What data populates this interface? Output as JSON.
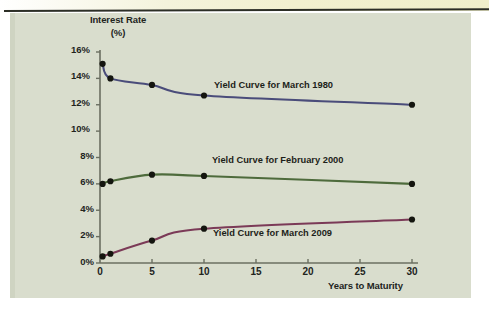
{
  "figure": {
    "background_color": "#d9ddcd",
    "page_color": "#ffffff",
    "top_strip_color": "#f1efcd",
    "rule_color": "#2c2e26"
  },
  "axes": {
    "y_title_line1": "Interest Rate",
    "y_title_line2": "(%)",
    "x_title": "Years to Maturity",
    "y_ticks": [
      "0%",
      "2%",
      "4%",
      "6%",
      "8%",
      "10%",
      "12%",
      "14%",
      "16%"
    ],
    "x_ticks": [
      "0",
      "5",
      "10",
      "15",
      "20",
      "25",
      "30"
    ],
    "axis_color": "#6b6f61"
  },
  "annotations": {
    "label_1980": "Yield Curve for March 1980",
    "label_2000": "Yield Curve for February 2000",
    "label_2009": "Yield Curve for March 2009"
  },
  "chart_data": {
    "type": "line",
    "title": "",
    "xlabel": "Years to Maturity",
    "ylabel": "Interest Rate (%)",
    "xlim": [
      0,
      30
    ],
    "ylim": [
      0,
      16
    ],
    "x_ticks": [
      0,
      5,
      10,
      15,
      20,
      25,
      30
    ],
    "y_ticks": [
      0,
      2,
      4,
      6,
      8,
      10,
      12,
      14,
      16
    ],
    "grid": false,
    "legend": "inline-annotations",
    "markers": "filled-circle",
    "series": [
      {
        "name": "Yield Curve for March 1980",
        "color": "#4a4c7a",
        "x": [
          0.25,
          1,
          5,
          10,
          30
        ],
        "values": [
          15.1,
          14.0,
          13.5,
          12.7,
          12.0
        ]
      },
      {
        "name": "Yield Curve for February 2000",
        "color": "#4e6b3c",
        "x": [
          0.25,
          1,
          5,
          10,
          30
        ],
        "values": [
          6.0,
          6.2,
          6.7,
          6.6,
          6.0
        ]
      },
      {
        "name": "Yield Curve for March 2009",
        "color": "#7b3a57",
        "x": [
          0.25,
          1,
          5,
          10,
          30
        ],
        "values": [
          0.5,
          0.7,
          1.7,
          2.6,
          3.3
        ]
      }
    ]
  }
}
